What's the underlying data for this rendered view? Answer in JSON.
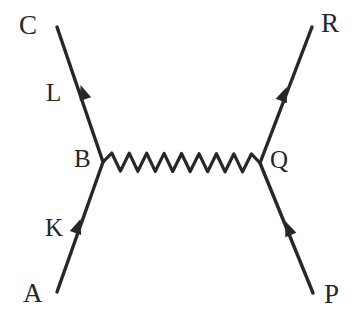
{
  "diagram": {
    "type": "feynman-diagram",
    "background_color": "#ffffff",
    "stroke_color": "#26262b",
    "stroke_width": 3.2,
    "width": 361,
    "height": 315,
    "vertices": [
      {
        "id": "B",
        "label": "B",
        "x": 103,
        "y": 162
      },
      {
        "id": "Q",
        "label": "Q",
        "x": 260,
        "y": 163
      }
    ],
    "propagator": {
      "name": "wavy-boson-propagator",
      "style": "wavy",
      "from": "B",
      "to": "Q",
      "x1": 103,
      "y1": 162,
      "x2": 260,
      "y2": 163,
      "cycles": 9,
      "amplitude": 9
    },
    "legs": [
      {
        "id": "leg-out-left",
        "name": "outgoing-fermion-left",
        "endpoint_label": "C",
        "momentum_label": "L",
        "direction": "outgoing",
        "x1": 103,
        "y1": 162,
        "x2": 57,
        "y2": 27,
        "arrow": {
          "x": 83,
          "y": 92,
          "points": "up-left"
        }
      },
      {
        "id": "leg-in-left",
        "name": "incoming-fermion-left",
        "endpoint_label": "A",
        "momentum_label": "K",
        "direction": "incoming",
        "x1": 57,
        "y1": 292,
        "x2": 103,
        "y2": 162,
        "arrow": {
          "x": 78,
          "y": 226,
          "points": "up-right"
        }
      },
      {
        "id": "leg-out-right",
        "name": "outgoing-fermion-right",
        "endpoint_label": "R",
        "momentum_label": "",
        "direction": "outgoing",
        "x1": 260,
        "y1": 163,
        "x2": 312,
        "y2": 27,
        "arrow": {
          "x": 284,
          "y": 94,
          "points": "up-right"
        }
      },
      {
        "id": "leg-in-right",
        "name": "incoming-fermion-right",
        "endpoint_label": "P",
        "momentum_label": "",
        "direction": "incoming",
        "x1": 313,
        "y1": 293,
        "x2": 260,
        "y2": 163,
        "arrow": {
          "x": 288,
          "y": 228,
          "points": "up-left"
        }
      }
    ],
    "labels": {
      "C": "C",
      "R": "R",
      "A": "A",
      "P": "P",
      "L": "L",
      "K": "K",
      "B": "B",
      "Q": "Q"
    }
  }
}
